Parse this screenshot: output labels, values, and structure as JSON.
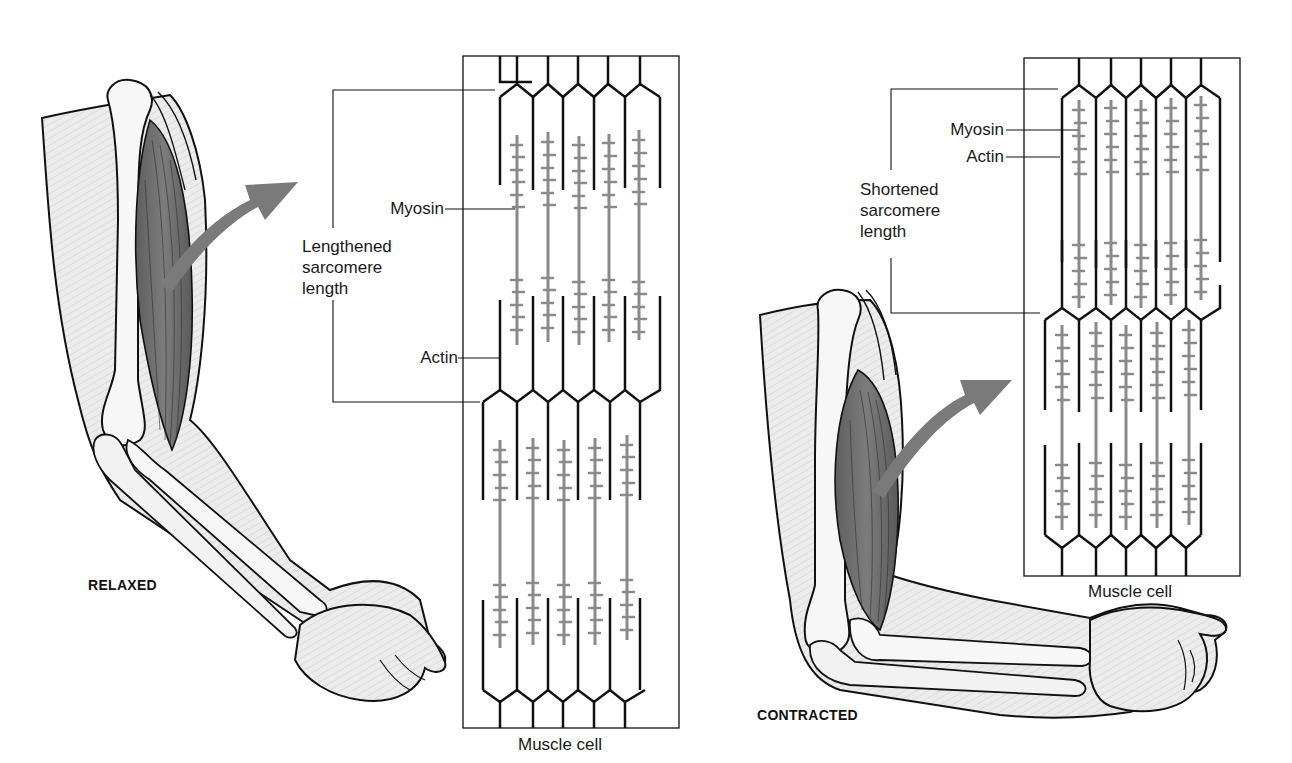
{
  "figure": {
    "colors": {
      "line": "#111111",
      "filament_gray": "#8a8a8a",
      "arrow_gray": "#7a7a7a",
      "muscle_dark": "#6e6e6e",
      "skin_light": "#e9e9e9",
      "bone": "#f7f7f7",
      "background": "#ffffff"
    }
  },
  "relaxed_panel": {
    "state_label": "RELAXED",
    "muscle_cell_caption": "Muscle cell",
    "sarcomere_label": "Lengthened\nsarcomere\nlength",
    "myosin_label": "Myosin",
    "actin_label": "Actin",
    "filament_columns": 5,
    "sarcomere_rows": 2
  },
  "contracted_panel": {
    "state_label": "CONTRACTED",
    "muscle_cell_caption": "Muscle cell",
    "sarcomere_label": "Shortened\nsarcomere\nlength",
    "myosin_label": "Myosin",
    "actin_label": "Actin",
    "filament_columns": 5,
    "sarcomere_rows": 2
  }
}
